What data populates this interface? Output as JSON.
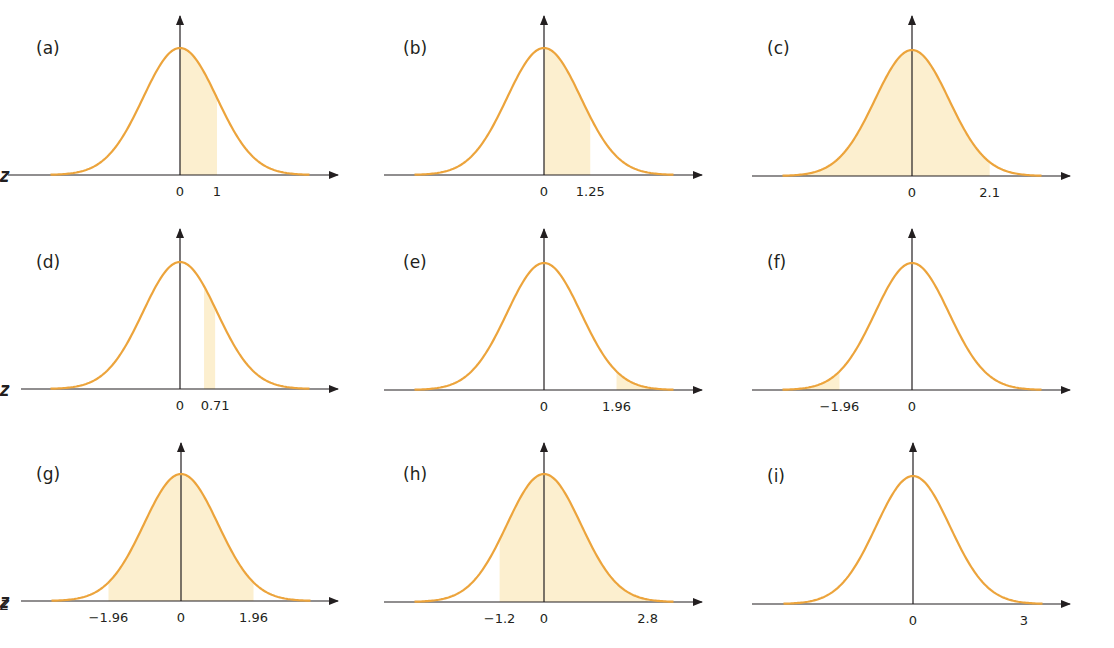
{
  "colors": {
    "curve": "#eca43c",
    "fill": "#fcefcf",
    "axis": "#231f20"
  },
  "chart_data": {
    "type": "area",
    "xlabel": "z",
    "ylabel": "",
    "grid": false,
    "panels": [
      {
        "id": "a",
        "label": "(a)",
        "ticks": [
          {
            "z": 0,
            "text": "0"
          },
          {
            "z": 1,
            "text": "1"
          }
        ],
        "shade": [
          0,
          1
        ]
      },
      {
        "id": "b",
        "label": "(b)",
        "ticks": [
          {
            "z": 0,
            "text": "0"
          },
          {
            "z": 1.25,
            "text": "1.25"
          }
        ],
        "shade": [
          0,
          1.25
        ]
      },
      {
        "id": "c",
        "label": "(c)",
        "ticks": [
          {
            "z": 0,
            "text": "0"
          },
          {
            "z": 2.1,
            "text": "2.1"
          }
        ],
        "shade": [
          -3.5,
          2.1
        ]
      },
      {
        "id": "d",
        "label": "(d)",
        "ticks": [
          {
            "z": 0,
            "text": "0"
          },
          {
            "z": 0.95,
            "text": "0.71"
          }
        ],
        "shade": [
          0.65,
          0.95
        ]
      },
      {
        "id": "e",
        "label": "(e)",
        "ticks": [
          {
            "z": 0,
            "text": "0"
          },
          {
            "z": 1.96,
            "text": "1.96"
          }
        ],
        "shade": [
          1.96,
          3.5
        ]
      },
      {
        "id": "f",
        "label": "(f)",
        "ticks": [
          {
            "z": -1.96,
            "text": "−1.96"
          },
          {
            "z": 0,
            "text": "0"
          }
        ],
        "shade": [
          -3.5,
          -1.96
        ]
      },
      {
        "id": "g",
        "label": "(g)",
        "ticks": [
          {
            "z": -1.96,
            "text": "−1.96"
          },
          {
            "z": 0,
            "text": "0"
          },
          {
            "z": 1.96,
            "text": "1.96"
          }
        ],
        "shade": [
          -1.96,
          1.96
        ]
      },
      {
        "id": "h",
        "label": "(h)",
        "ticks": [
          {
            "z": -1.2,
            "text": "−1.2"
          },
          {
            "z": 0,
            "text": "0"
          },
          {
            "z": 2.8,
            "text": "2.8"
          }
        ],
        "shade": [
          -1.2,
          2.8
        ]
      },
      {
        "id": "i",
        "label": "(i)",
        "ticks": [
          {
            "z": 0,
            "text": "0"
          },
          {
            "z": 3,
            "text": "3"
          }
        ],
        "shade": null
      }
    ]
  },
  "layout": {
    "panels": [
      {
        "cx": 180,
        "axisY": 175,
        "peakY": 48,
        "arrowTop": 16,
        "left": 8,
        "right": 338,
        "sigma": 37,
        "labelX": 36,
        "labelY": 54
      },
      {
        "cx": 544,
        "axisY": 175,
        "peakY": 48,
        "arrowTop": 16,
        "left": 384,
        "right": 702,
        "sigma": 37,
        "labelX": 403,
        "labelY": 54
      },
      {
        "cx": 912,
        "axisY": 176,
        "peakY": 50,
        "arrowTop": 16,
        "left": 752,
        "right": 1070,
        "sigma": 37,
        "labelX": 767,
        "labelY": 54
      },
      {
        "cx": 180,
        "axisY": 389,
        "peakY": 262,
        "arrowTop": 229,
        "left": 21,
        "right": 338,
        "sigma": 37,
        "labelX": 36,
        "labelY": 268
      },
      {
        "cx": 544,
        "axisY": 390,
        "peakY": 263,
        "arrowTop": 229,
        "left": 384,
        "right": 702,
        "sigma": 37,
        "labelX": 403,
        "labelY": 268
      },
      {
        "cx": 912,
        "axisY": 390,
        "peakY": 263,
        "arrowTop": 229,
        "left": 752,
        "right": 1070,
        "sigma": 37,
        "labelX": 767,
        "labelY": 268
      },
      {
        "cx": 181,
        "axisY": 601,
        "peakY": 474,
        "arrowTop": 443,
        "left": 21,
        "right": 338,
        "sigma": 37,
        "labelX": 36,
        "labelY": 480
      },
      {
        "cx": 544,
        "axisY": 602,
        "peakY": 474,
        "arrowTop": 443,
        "left": 384,
        "right": 702,
        "sigma": 37,
        "labelX": 403,
        "labelY": 480
      },
      {
        "cx": 913,
        "axisY": 604,
        "peakY": 476,
        "arrowTop": 443,
        "left": 752,
        "right": 1070,
        "sigma": 37,
        "labelX": 767,
        "labelY": 482
      }
    ],
    "tickOffset": 21,
    "zOffset": 20
  }
}
